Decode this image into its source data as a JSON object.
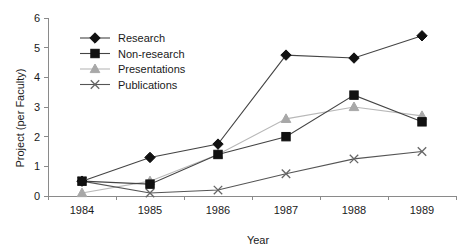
{
  "chart_data": {
    "type": "line",
    "title": "",
    "xlabel": "Year",
    "ylabel": "Project (per Faculty)",
    "categories": [
      "1984",
      "1985",
      "1986",
      "1987",
      "1988",
      "1989"
    ],
    "x": [
      1984,
      1985,
      1986,
      1987,
      1988,
      1989
    ],
    "ylim": [
      0,
      6
    ],
    "yticks": [
      0,
      1,
      2,
      3,
      4,
      5,
      6
    ],
    "ytick_labels": [
      "0",
      "1",
      "2",
      "3",
      "4",
      "5",
      "6"
    ],
    "grid": false,
    "legend_position": "upper-left-inside",
    "series": [
      {
        "name": "Research",
        "marker": "diamond",
        "color": "#111111",
        "line_color": "#444444",
        "values": [
          0.5,
          1.3,
          1.75,
          4.75,
          4.65,
          5.4
        ]
      },
      {
        "name": "Non-research",
        "marker": "square",
        "color": "#111111",
        "line_color": "#444444",
        "values": [
          0.5,
          0.4,
          1.4,
          2.0,
          3.4,
          2.5
        ]
      },
      {
        "name": "Presentations",
        "marker": "triangle",
        "color": "#a8a8a8",
        "line_color": "#b8b8b8",
        "values": [
          0.1,
          0.5,
          1.4,
          2.6,
          3.0,
          2.7
        ]
      },
      {
        "name": "Publications",
        "marker": "cross",
        "color": "#666666",
        "line_color": "#555555",
        "values": [
          0.5,
          0.1,
          0.2,
          0.75,
          1.25,
          1.5
        ]
      }
    ]
  },
  "legend": {
    "items": [
      {
        "label": "Research"
      },
      {
        "label": "Non-research"
      },
      {
        "label": "Presentations"
      },
      {
        "label": "Publications"
      }
    ]
  },
  "axes": {
    "y_title": "Project (per Faculty)",
    "x_title": "Year"
  },
  "colors": {
    "axis": "#8a8a8a",
    "text": "#1a1a1a",
    "dark_marker": "#111111",
    "gray_marker": "#a8a8a8",
    "background": "#ffffff"
  }
}
